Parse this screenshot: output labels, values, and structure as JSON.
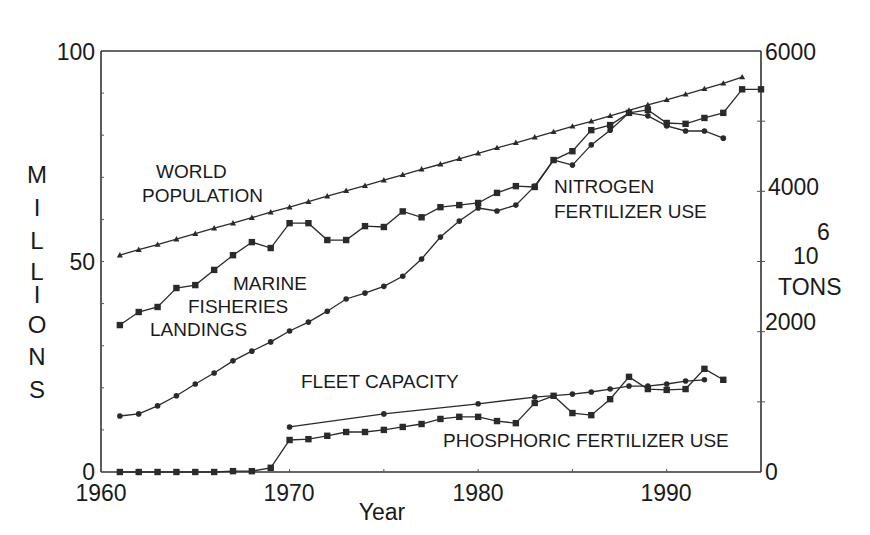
{
  "chart_data": {
    "type": "line",
    "title": "",
    "xlabel": "Year",
    "ylabel_left": "MILLIONS",
    "ylabel_right": "10^6 TONS",
    "ylabel_right_parts": {
      "exponent": "6",
      "base": "10",
      "unit": "TONS"
    },
    "xlim": [
      1960,
      1995
    ],
    "ylim_left": [
      0,
      100
    ],
    "ylim_right": [
      0,
      6000
    ],
    "x_ticks": [
      1960,
      1970,
      1980,
      1990
    ],
    "y_ticks_left": [
      0,
      50,
      100
    ],
    "y_ticks_right": [
      0,
      2000,
      4000,
      6000
    ],
    "grid": false,
    "legend": "inline labels",
    "series": [
      {
        "name": "WORLD POPULATION",
        "label_lines": [
          "WORLD",
          "POPULATION"
        ],
        "marker": "triangle",
        "x": [
          1961,
          1962,
          1963,
          1964,
          1965,
          1966,
          1967,
          1968,
          1969,
          1970,
          1971,
          1972,
          1973,
          1974,
          1975,
          1976,
          1977,
          1978,
          1979,
          1980,
          1981,
          1982,
          1983,
          1984,
          1985,
          1986,
          1987,
          1988,
          1989,
          1990,
          1991,
          1992,
          1993,
          1994
        ],
        "values": [
          51.5,
          52.8,
          54.0,
          55.3,
          56.6,
          57.9,
          59.1,
          60.4,
          61.7,
          62.9,
          64.2,
          65.5,
          66.8,
          68.0,
          69.3,
          70.6,
          71.9,
          73.1,
          74.4,
          75.7,
          77.0,
          78.2,
          79.5,
          80.8,
          82.1,
          83.3,
          84.6,
          85.9,
          87.2,
          88.4,
          89.7,
          91.0,
          92.3,
          93.8
        ]
      },
      {
        "name": "MARINE FISHERIES LANDINGS",
        "label_lines": [
          "MARINE",
          "FISHERIES",
          "LANDINGS"
        ],
        "marker": "square",
        "x": [
          1961,
          1962,
          1963,
          1964,
          1965,
          1966,
          1967,
          1968,
          1969,
          1970,
          1971,
          1972,
          1973,
          1974,
          1975,
          1976,
          1977,
          1978,
          1979,
          1980,
          1981,
          1982,
          1983,
          1984,
          1985,
          1986,
          1987,
          1988,
          1989,
          1990,
          1991,
          1992,
          1993,
          1994,
          1995
        ],
        "values": [
          34.9,
          38.0,
          39.2,
          43.7,
          44.4,
          48.0,
          51.5,
          54.6,
          53.2,
          59.1,
          59.1,
          55.1,
          55.1,
          58.4,
          58.2,
          61.9,
          60.5,
          62.9,
          63.4,
          63.9,
          66.3,
          67.9,
          67.7,
          74.1,
          76.2,
          81.2,
          82.4,
          85.3,
          86.0,
          82.9,
          82.7,
          84.1,
          85.3,
          90.9,
          90.9
        ]
      },
      {
        "name": "NITROGEN FERTILIZER USE",
        "label_lines": [
          "NITROGEN",
          "FERTILIZER USE"
        ],
        "marker": "circle",
        "x": [
          1961,
          1962,
          1963,
          1964,
          1965,
          1966,
          1967,
          1968,
          1969,
          1970,
          1971,
          1972,
          1973,
          1974,
          1975,
          1976,
          1977,
          1978,
          1979,
          1980,
          1981,
          1982,
          1983,
          1984,
          1985,
          1986,
          1987,
          1988,
          1989,
          1990,
          1991,
          1992,
          1993
        ],
        "values": [
          13.3,
          13.8,
          15.7,
          18.1,
          20.9,
          23.5,
          26.4,
          28.7,
          30.9,
          33.5,
          35.6,
          38.2,
          41.1,
          42.5,
          44.1,
          46.5,
          50.6,
          55.8,
          59.6,
          62.7,
          62.0,
          63.4,
          67.9,
          74.1,
          72.9,
          77.7,
          81.2,
          85.3,
          84.6,
          82.2,
          81.0,
          81.0,
          79.3
        ]
      },
      {
        "name": "FLEET CAPACITY",
        "label_lines": [
          "FLEET CAPACITY"
        ],
        "marker": "circle",
        "x": [
          1970,
          1975,
          1980,
          1983,
          1985,
          1986,
          1987,
          1988,
          1989,
          1990,
          1991,
          1992
        ],
        "values": [
          10.7,
          13.8,
          16.2,
          17.8,
          18.5,
          19.0,
          19.7,
          20.4,
          20.4,
          20.9,
          21.6,
          21.9
        ]
      },
      {
        "name": "PHOSPHORIC FERTILIZER USE",
        "label_lines": [
          "PHOSPHORIC FERTILIZER USE"
        ],
        "marker": "square",
        "x": [
          1961,
          1962,
          1963,
          1964,
          1965,
          1966,
          1967,
          1968,
          1969,
          1970,
          1971,
          1972,
          1973,
          1974,
          1975,
          1976,
          1977,
          1978,
          1979,
          1980,
          1981,
          1982,
          1983,
          1984,
          1985,
          1986,
          1987,
          1988,
          1989,
          1990,
          1991,
          1992,
          1993
        ],
        "values": [
          0,
          0,
          0,
          0,
          0,
          0,
          0.2,
          0.2,
          1.0,
          7.6,
          7.8,
          8.6,
          9.5,
          9.5,
          10.0,
          10.7,
          11.4,
          12.6,
          13.1,
          13.1,
          12.1,
          11.6,
          16.4,
          18.1,
          14.0,
          13.5,
          17.3,
          22.6,
          19.7,
          19.5,
          19.7,
          24.5,
          21.9
        ]
      }
    ]
  },
  "labels": {
    "xlabel": "Year",
    "ylabel_left_letters": [
      "M",
      "I",
      "L",
      "L",
      "I",
      "O",
      "N",
      "S"
    ],
    "right_exponent": "6",
    "right_base": "10",
    "right_unit": "TONS",
    "world_population": [
      "WORLD",
      "POPULATION"
    ],
    "marine_fisheries": [
      "MARINE",
      "FISHERIES",
      "LANDINGS"
    ],
    "nitrogen": [
      "NITROGEN",
      "FERTILIZER USE"
    ],
    "fleet": "FLEET CAPACITY",
    "phosphoric": "PHOSPHORIC FERTILIZER USE",
    "x_ticks": [
      "1960",
      "1970",
      "1980",
      "1990"
    ],
    "y_left_ticks": [
      "100",
      "50",
      "0"
    ],
    "y_right_ticks": [
      "6000",
      "4000",
      "2000",
      "0"
    ]
  },
  "colors": {
    "line": "#2a2a2a",
    "text": "#1a1a1a",
    "background": "#ffffff"
  }
}
